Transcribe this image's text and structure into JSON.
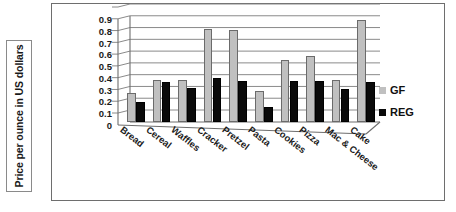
{
  "axis_title": {
    "text": "Price per ounce in US dollars"
  },
  "legend": {
    "position": "right",
    "entries": [
      {
        "label": "GF",
        "color": "#c0c0c0",
        "swatch": "gf-swatch-icon"
      },
      {
        "label": "REG",
        "color": "#0a0a0a",
        "swatch": "reg-swatch-icon"
      }
    ]
  },
  "caption": {
    "text": "",
    "note": ""
  },
  "chart_data": {
    "type": "bar",
    "title": "",
    "xlabel": "",
    "ylabel": "Price per ounce in US dollars",
    "ylim": [
      0,
      0.9
    ],
    "yticks": [
      "0",
      "0.1",
      "0.2",
      "0.3",
      "0.4",
      "0.5",
      "0.6",
      "0.7",
      "0.8",
      "0.9"
    ],
    "ytick_values": [
      0,
      0.1,
      0.2,
      0.3,
      0.4,
      0.5,
      0.6,
      0.7,
      0.8,
      0.9
    ],
    "grid": true,
    "legend_position": "right",
    "categories": [
      "Bread",
      "Cereal",
      "Waffles",
      "Cracker",
      "Pretzel",
      "Pasta",
      "Cookies",
      "Pizza",
      "Mac & Cheese",
      "Cake"
    ],
    "series": [
      {
        "name": "GF",
        "color": "#c0c0c0",
        "values": [
          0.25,
          0.36,
          0.36,
          0.79,
          0.78,
          0.26,
          0.53,
          0.56,
          0.355,
          0.87
        ]
      },
      {
        "name": "REG",
        "color": "#0a0a0a",
        "values": [
          0.17,
          0.34,
          0.29,
          0.37,
          0.35,
          0.13,
          0.35,
          0.35,
          0.28,
          0.34
        ]
      }
    ]
  }
}
